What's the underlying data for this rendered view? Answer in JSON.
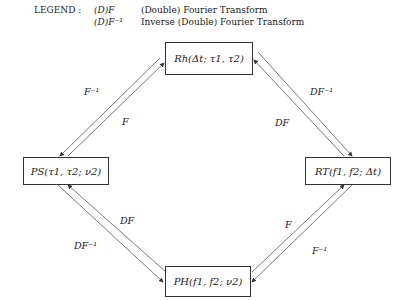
{
  "legend": {
    "title": "LEGEND :",
    "entries": [
      {
        "symbol": "(D)F",
        "description": "(Double) Fourier Transform"
      },
      {
        "symbol": "(D)F⁻¹",
        "description": "Inverse (Double) Fourier Transform"
      }
    ]
  },
  "nodes": {
    "top": "Rh(Δt; τ1, τ2)",
    "left": "PS(τ1, τ2; ν2)",
    "right": "RT(f1, f2; Δt)",
    "bottom": "PH(f1, f2; ν2)"
  },
  "edges": {
    "top_left_outer": "F⁻¹",
    "top_left_inner": "F",
    "top_right_outer": "DF⁻¹",
    "top_right_inner": "DF",
    "bottom_left_inner": "DF",
    "bottom_left_outer": "DF⁻¹",
    "bottom_right_inner": "F",
    "bottom_right_outer": "F⁻¹"
  },
  "colors": {
    "line": "#333333",
    "background": "#ffffff"
  }
}
